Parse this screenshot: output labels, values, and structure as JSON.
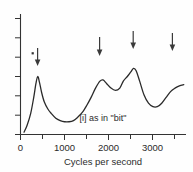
{
  "chart_data": {
    "type": "line",
    "title": "",
    "subtitle": "",
    "annotation": "[i] as in \"bit\"",
    "xlabel": "Cycles per second",
    "ylabel": "",
    "xlim": [
      0,
      3750
    ],
    "ylim": [
      0,
      100
    ],
    "grid": false,
    "legend": null,
    "x_ticks_major": [
      0,
      1000,
      2000,
      3000
    ],
    "x_tick_labels": [
      "0",
      "1000",
      "2000",
      "3000"
    ],
    "x_ticks_minor": [
      500,
      1500,
      2500,
      3500
    ],
    "y_ticks": [
      0,
      16,
      32,
      48,
      64,
      80,
      96
    ],
    "y_tick_labels": [
      "",
      "",
      "",
      "",
      "",
      "",
      ""
    ],
    "formant_arrows": [
      {
        "x": 390,
        "label": "F1"
      },
      {
        "x": 1800,
        "label": "F2"
      },
      {
        "x": 2560,
        "label": "F3"
      },
      {
        "x": 3450,
        "label": "F4"
      }
    ],
    "dot_marker": {
      "x": 270,
      "y": 62
    },
    "x": [
      80,
      150,
      230,
      300,
      350,
      390,
      430,
      480,
      540,
      620,
      700,
      800,
      900,
      1000,
      1100,
      1200,
      1300,
      1400,
      1500,
      1600,
      1700,
      1800,
      1870,
      1950,
      2050,
      2150,
      2250,
      2330,
      2420,
      2500,
      2560,
      2620,
      2700,
      2800,
      2900,
      3000,
      3100,
      3200,
      3300,
      3400,
      3500,
      3600,
      3700
    ],
    "y": [
      2,
      8,
      18,
      32,
      44,
      50,
      45,
      36,
      28,
      22,
      18,
      14,
      12,
      11,
      11,
      12,
      15,
      19,
      25,
      32,
      40,
      46,
      47,
      44,
      40,
      38,
      40,
      46,
      50,
      54,
      57,
      55,
      46,
      34,
      27,
      24,
      24,
      27,
      32,
      37,
      40,
      42,
      43
    ]
  }
}
